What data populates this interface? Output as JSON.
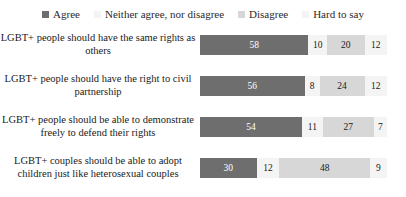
{
  "chart_data": {
    "type": "bar",
    "orientation": "horizontal",
    "stacked": true,
    "stacked_mode": "percent",
    "title": "",
    "subtitle": "",
    "xlabel": "",
    "ylabel": "",
    "xlim": [
      0,
      100
    ],
    "grid": false,
    "legend_position": "top-center",
    "categories": [
      "LGBT+ people should have the same rights as others",
      "LGBT+ people should have the right to civil partnership",
      "LGBT+ people should be able to demonstrate freely to defend their rights",
      "LGBT+ couples should be able to adopt children just like heterosexual couples"
    ],
    "series": [
      {
        "name": "Agree",
        "color": "#6e6e6e",
        "values": [
          58,
          56,
          54,
          30
        ]
      },
      {
        "name": "Neither agree, nor disagree",
        "color": "#f4f4f4",
        "values": [
          10,
          8,
          11,
          12
        ]
      },
      {
        "name": "Disagree",
        "color": "#d7d7d7",
        "values": [
          20,
          24,
          27,
          48
        ]
      },
      {
        "name": "Hard to say",
        "color": "#f4f4f4",
        "values": [
          12,
          12,
          7,
          9
        ]
      }
    ]
  },
  "legend": {
    "items": [
      {
        "label": "Agree",
        "swatch_name": "legend-swatch-agree"
      },
      {
        "label": "Neither agree, nor disagree",
        "swatch_name": "legend-swatch-neither"
      },
      {
        "label": "Disagree",
        "swatch_name": "legend-swatch-disagree"
      },
      {
        "label": "Hard to say",
        "swatch_name": "legend-swatch-hard-to-say"
      }
    ]
  }
}
